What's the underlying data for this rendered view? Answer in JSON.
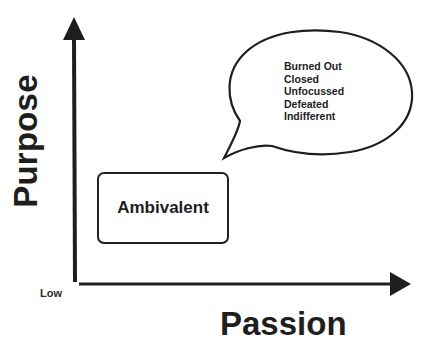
{
  "diagram": {
    "y_axis": {
      "label": "Purpose",
      "icon": "arrow-up-icon"
    },
    "x_axis": {
      "label": "Passion",
      "icon": "arrow-right-icon"
    },
    "origin_label": "Low",
    "quadrant_box": {
      "label": "Ambivalent"
    },
    "speech_bubble": {
      "items": [
        "Burned Out",
        "Closed",
        "Unfocussed",
        "Defeated",
        "Indifferent"
      ]
    },
    "colors": {
      "ink": "#1e1e1e",
      "background": "#ffffff"
    }
  }
}
